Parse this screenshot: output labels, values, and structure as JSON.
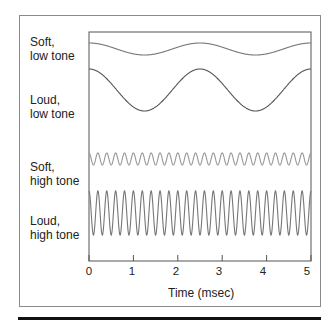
{
  "chart_data": {
    "type": "line",
    "title": "",
    "xlabel": "Time (msec)",
    "ylabel": "",
    "xlim": [
      0,
      5
    ],
    "x_ticks": [
      "0",
      "1",
      "2",
      "3",
      "4",
      "5"
    ],
    "grid": false,
    "legend": "none",
    "series": [
      {
        "name": "Soft, low tone",
        "label_line1": "Soft,",
        "label_line2": "low tone",
        "frequency_khz": 0.4,
        "relative_amplitude": 0.35,
        "color": "#777777"
      },
      {
        "name": "Loud, low tone",
        "label_line1": "Loud,",
        "label_line2": "low tone",
        "frequency_khz": 0.4,
        "relative_amplitude": 1.0,
        "color": "#555555"
      },
      {
        "name": "Soft, high tone",
        "label_line1": "Soft,",
        "label_line2": "high tone",
        "frequency_khz": 5.0,
        "relative_amplitude": 0.35,
        "color": "#999999"
      },
      {
        "name": "Loud, high tone",
        "label_line1": "Loud,",
        "label_line2": "high tone",
        "frequency_khz": 5.0,
        "relative_amplitude": 1.0,
        "color": "#777777"
      }
    ]
  }
}
